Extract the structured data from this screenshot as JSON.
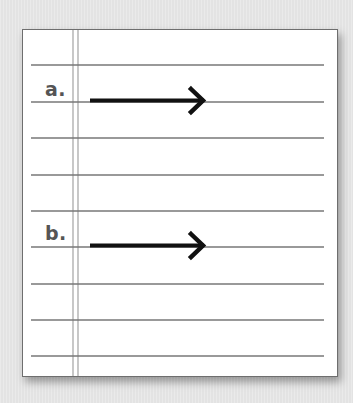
{
  "worksheet": {
    "ruled_line_ys": [
      65,
      102,
      138,
      175,
      211,
      247,
      284,
      320,
      356
    ],
    "line_color": "#777777",
    "margin_line_color": "#aaaaaa",
    "items": [
      {
        "label": "a.",
        "arrow": "right-arrow",
        "baseline_y": 102
      },
      {
        "label": "b.",
        "arrow": "right-arrow",
        "baseline_y": 247
      }
    ]
  }
}
